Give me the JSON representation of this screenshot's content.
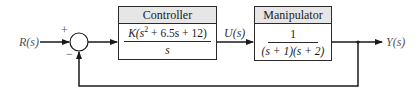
{
  "diagram": {
    "type": "block-diagram",
    "input_label": "R(s)",
    "output_label": "Y(s)",
    "intermediate_label": "U(s)",
    "summing_junction": {
      "plus_sign": "+",
      "minus_sign": "−"
    },
    "blocks": [
      {
        "title": "Controller",
        "numerator": "K(s² + 6.5s + 12)",
        "numerator_parts": {
          "pre": "K(s",
          "exp": "2",
          "post": " + 6.5s + 12)"
        },
        "denominator": "s"
      },
      {
        "title": "Manipulator",
        "numerator": "1",
        "denominator": "(s + 1)(s + 2)"
      }
    ],
    "feedback": "unity negative feedback from Y(s) to summing junction"
  },
  "colors": {
    "line": "#1a1a1a",
    "header_bg": "#e6e6e6",
    "label": "#555555"
  }
}
